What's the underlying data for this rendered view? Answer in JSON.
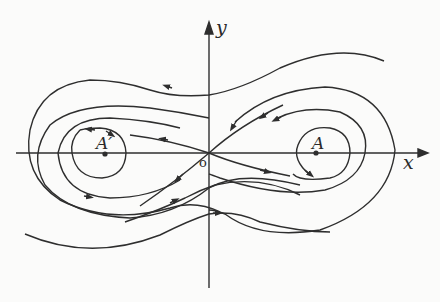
{
  "diagram": {
    "type": "phase-portrait",
    "axes": {
      "x_label": "x",
      "y_label": "y",
      "origin_label": "o"
    },
    "points": [
      {
        "id": "A",
        "label": "A",
        "role": "center (right)"
      },
      {
        "id": "A_prime",
        "label": "A′",
        "role": "center (left)"
      },
      {
        "id": "O",
        "label": "o",
        "role": "saddle at origin"
      }
    ],
    "colors": {
      "stroke": "#2e2e2e",
      "background": "#fbfbfa"
    }
  }
}
